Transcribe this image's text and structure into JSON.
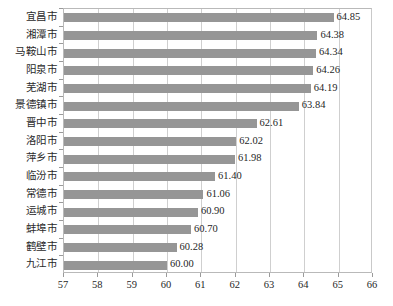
{
  "chart_data": {
    "type": "bar",
    "orientation": "horizontal",
    "title": "",
    "subtitle": "",
    "xlabel": "",
    "ylabel": "",
    "xlim": [
      57,
      66
    ],
    "xticks": [
      57,
      58,
      59,
      60,
      61,
      62,
      63,
      64,
      65,
      66
    ],
    "xtick_labels": [
      "57",
      "58",
      "59",
      "60",
      "61",
      "62",
      "63",
      "64",
      "65",
      "66"
    ],
    "grid": true,
    "grid_axis": "x",
    "legend": null,
    "bar_color": "#969696",
    "plot_border_color": "#b9b9b9",
    "gridline_color": "#cfcfcf",
    "categories": [
      "宜昌市",
      "湘潭市",
      "马鞍山市",
      "阳泉市",
      "芜湖市",
      "景德镇市",
      "晋中市",
      "洛阳市",
      "萍乡市",
      "临汾市",
      "常德市",
      "运城市",
      "蚌埠市",
      "鹤壁市",
      "九江市"
    ],
    "values": [
      64.85,
      64.38,
      64.34,
      64.26,
      64.19,
      63.84,
      62.61,
      62.02,
      61.98,
      61.4,
      61.06,
      60.9,
      60.7,
      60.28,
      60.0
    ],
    "data_labels": [
      "64.85",
      "64.38",
      "64.34",
      "64.26",
      "64.19",
      "63.84",
      "62.61",
      "62.02",
      "61.98",
      "61.40",
      "61.06",
      "60.90",
      "60.70",
      "60.28",
      "60.00"
    ]
  }
}
